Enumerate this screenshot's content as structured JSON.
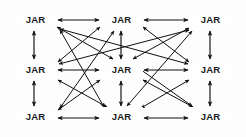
{
  "diagram": {
    "node_label": "JAR",
    "background_color": "#fdfdfd",
    "node_fill": "#fefefe",
    "node_border_color": "#8d8d8d",
    "edge_color": "#111111",
    "grid": {
      "rows": 3,
      "cols": 3,
      "node_count": 9
    },
    "nodes": [
      {
        "id": "n00",
        "label": "JAR",
        "row": 0,
        "col": 0,
        "x": 14,
        "y": 10,
        "w": 43,
        "h": 20
      },
      {
        "id": "n01",
        "label": "JAR",
        "row": 0,
        "col": 1,
        "x": 100,
        "y": 10,
        "w": 43,
        "h": 20
      },
      {
        "id": "n02",
        "label": "JAR",
        "row": 0,
        "col": 2,
        "x": 189,
        "y": 10,
        "w": 43,
        "h": 20
      },
      {
        "id": "n10",
        "label": "JAR",
        "row": 1,
        "col": 0,
        "x": 14,
        "y": 60,
        "w": 43,
        "h": 20
      },
      {
        "id": "n11",
        "label": "JAR",
        "row": 1,
        "col": 1,
        "x": 100,
        "y": 60,
        "w": 43,
        "h": 20
      },
      {
        "id": "n12",
        "label": "JAR",
        "row": 1,
        "col": 2,
        "x": 189,
        "y": 60,
        "w": 43,
        "h": 20
      },
      {
        "id": "n20",
        "label": "JAR",
        "row": 2,
        "col": 0,
        "x": 14,
        "y": 107,
        "w": 43,
        "h": 20
      },
      {
        "id": "n21",
        "label": "JAR",
        "row": 2,
        "col": 1,
        "x": 100,
        "y": 107,
        "w": 43,
        "h": 20
      },
      {
        "id": "n22",
        "label": "JAR",
        "row": 2,
        "col": 2,
        "x": 189,
        "y": 107,
        "w": 43,
        "h": 20
      }
    ],
    "edges": [
      {
        "from": "n00",
        "to": "n01",
        "kind": "horizontal",
        "arrows": "both",
        "x1": 58,
        "y1": 20,
        "x2": 99,
        "y2": 20
      },
      {
        "from": "n01",
        "to": "n02",
        "kind": "horizontal",
        "arrows": "both",
        "x1": 144,
        "y1": 20,
        "x2": 188,
        "y2": 20
      },
      {
        "from": "n10",
        "to": "n11",
        "kind": "horizontal",
        "arrows": "both",
        "x1": 58,
        "y1": 70,
        "x2": 99,
        "y2": 70
      },
      {
        "from": "n11",
        "to": "n12",
        "kind": "horizontal",
        "arrows": "both",
        "x1": 144,
        "y1": 70,
        "x2": 188,
        "y2": 70
      },
      {
        "from": "n20",
        "to": "n21",
        "kind": "horizontal",
        "arrows": "both",
        "x1": 58,
        "y1": 118,
        "x2": 99,
        "y2": 118
      },
      {
        "from": "n21",
        "to": "n22",
        "kind": "horizontal",
        "arrows": "both",
        "x1": 144,
        "y1": 118,
        "x2": 188,
        "y2": 118
      },
      {
        "from": "n00",
        "to": "n10",
        "kind": "vertical",
        "arrows": "both",
        "x1": 34,
        "y1": 31,
        "x2": 34,
        "y2": 59
      },
      {
        "from": "n10",
        "to": "n20",
        "kind": "vertical",
        "arrows": "both",
        "x1": 34,
        "y1": 81,
        "x2": 34,
        "y2": 106
      },
      {
        "from": "n01",
        "to": "n11",
        "kind": "vertical",
        "arrows": "both",
        "x1": 121,
        "y1": 31,
        "x2": 121,
        "y2": 59
      },
      {
        "from": "n11",
        "to": "n21",
        "kind": "vertical",
        "arrows": "both",
        "x1": 121,
        "y1": 81,
        "x2": 121,
        "y2": 106
      },
      {
        "from": "n02",
        "to": "n12",
        "kind": "vertical",
        "arrows": "both",
        "x1": 210,
        "y1": 31,
        "x2": 210,
        "y2": 59
      },
      {
        "from": "n12",
        "to": "n22",
        "kind": "vertical",
        "arrows": "both",
        "x1": 210,
        "y1": 81,
        "x2": 210,
        "y2": 106
      },
      {
        "from": "n00",
        "to": "n11",
        "kind": "diagonal",
        "arrows": "both",
        "x1": 57,
        "y1": 27,
        "x2": 113,
        "y2": 59
      },
      {
        "from": "n01",
        "to": "n10",
        "kind": "diagonal",
        "arrows": "both",
        "x1": 100,
        "y1": 27,
        "x2": 58,
        "y2": 62
      },
      {
        "from": "n01",
        "to": "n12",
        "kind": "diagonal",
        "arrows": "both",
        "x1": 143,
        "y1": 27,
        "x2": 189,
        "y2": 62
      },
      {
        "from": "n02",
        "to": "n11",
        "kind": "diagonal",
        "arrows": "both",
        "x1": 189,
        "y1": 28,
        "x2": 133,
        "y2": 59
      },
      {
        "from": "n10",
        "to": "n21",
        "kind": "diagonal",
        "arrows": "both",
        "x1": 58,
        "y1": 80,
        "x2": 107,
        "y2": 107
      },
      {
        "from": "n11",
        "to": "n20",
        "kind": "diagonal",
        "arrows": "both",
        "x1": 100,
        "y1": 80,
        "x2": 58,
        "y2": 110
      },
      {
        "from": "n11",
        "to": "n22",
        "kind": "diagonal",
        "arrows": "both",
        "x1": 143,
        "y1": 80,
        "x2": 193,
        "y2": 107
      },
      {
        "from": "n12",
        "to": "n21",
        "kind": "diagonal",
        "arrows": "both",
        "x1": 189,
        "y1": 80,
        "x2": 141,
        "y2": 108
      },
      {
        "from": "n20",
        "to": "n01",
        "kind": "long-diagonal",
        "arrows": "both",
        "x1": 60,
        "y1": 108,
        "x2": 114,
        "y2": 31
      },
      {
        "from": "n21",
        "to": "n00",
        "kind": "long-diagonal",
        "arrows": "both",
        "x1": 104,
        "y1": 107,
        "x2": 60,
        "y2": 30
      },
      {
        "from": "n10",
        "to": "n02",
        "kind": "long-diagonal",
        "arrows": "both",
        "x1": 59,
        "y1": 64,
        "x2": 189,
        "y2": 30
      },
      {
        "from": "n12",
        "to": "n00",
        "kind": "long-diagonal",
        "arrows": "both",
        "x1": 188,
        "y1": 64,
        "x2": 60,
        "y2": 29
      },
      {
        "from": "n21",
        "to": "n02",
        "kind": "long-diagonal",
        "arrows": "both",
        "x1": 127,
        "y1": 106,
        "x2": 192,
        "y2": 31
      },
      {
        "from": "n22",
        "to": "n11",
        "kind": "long-diagonal",
        "arrows": "both",
        "x1": 192,
        "y1": 106,
        "x2": 130,
        "y2": 62
      }
    ]
  }
}
